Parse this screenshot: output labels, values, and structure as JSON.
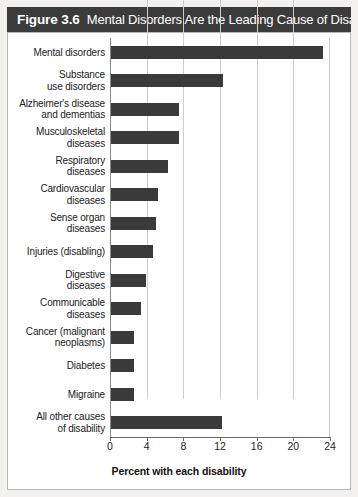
{
  "figure": {
    "number": "Figure 3.6",
    "title": "Mental Disorders Are the Leading Cause of Disability.",
    "bar_color": "#3a3a3a",
    "title_bar_color": "#3b3b3b",
    "panel_background": "#ffffff",
    "card_background": "#f2f1ee"
  },
  "chart_data": {
    "type": "bar",
    "orientation": "horizontal",
    "title": "Mental Disorders Are the Leading Cause of Disability.",
    "xlabel": "Percent with each disability",
    "ylabel": "",
    "xlim": [
      0,
      24
    ],
    "xticks": [
      0,
      4,
      8,
      12,
      16,
      20,
      24
    ],
    "xtick_labels": [
      "0",
      "4",
      "8",
      "12",
      "16",
      "20",
      "24"
    ],
    "grid": "vertical",
    "legend": "none",
    "categories": [
      "Mental disorders",
      "Substance use disorders",
      "Alzheimer's disease and dementias",
      "Musculoskeletal diseases",
      "Respiratory diseases",
      "Cardiovascular diseases",
      "Sense organ diseases",
      "Injuries (disabling)",
      "Digestive diseases",
      "Communicable diseases",
      "Cancer (malignant neoplasms)",
      "Diabetes",
      "Migraine",
      "All other causes of disability"
    ],
    "category_lines": [
      [
        "Mental disorders"
      ],
      [
        "Substance",
        "use disorders"
      ],
      [
        "Alzheimer's disease",
        "and dementias"
      ],
      [
        "Musculoskeletal",
        "diseases"
      ],
      [
        "Respiratory",
        "diseases"
      ],
      [
        "Cardiovascular",
        "diseases"
      ],
      [
        "Sense organ",
        "diseases"
      ],
      [
        "Injuries (disabling)"
      ],
      [
        "Digestive",
        "diseases"
      ],
      [
        "Communicable",
        "diseases"
      ],
      [
        "Cancer (malignant",
        "neoplasms)"
      ],
      [
        "Diabetes"
      ],
      [
        "Migraine"
      ],
      [
        "All other causes",
        "of disability"
      ]
    ],
    "values": [
      23.1,
      12.2,
      7.4,
      7.4,
      6.2,
      5.1,
      4.9,
      4.6,
      3.8,
      3.3,
      2.5,
      2.5,
      2.5,
      12.1
    ]
  }
}
